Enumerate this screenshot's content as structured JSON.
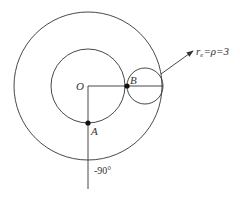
{
  "diagram": {
    "labels": {
      "origin": "O",
      "point_a": "A",
      "point_b": "B",
      "radius_label_r": "r",
      "radius_label_sub": "e",
      "radius_label_rest": "=ρ=3",
      "angle": "-90°"
    },
    "stroke_color": "#333333",
    "circles": [
      {
        "name": "outer-circle",
        "cx": 88,
        "cy": 86,
        "r": 74
      },
      {
        "name": "inner-circle",
        "cx": 88,
        "cy": 86,
        "r": 39
      },
      {
        "name": "rolling-circle",
        "cx": 145,
        "cy": 86,
        "r": 18
      }
    ]
  }
}
